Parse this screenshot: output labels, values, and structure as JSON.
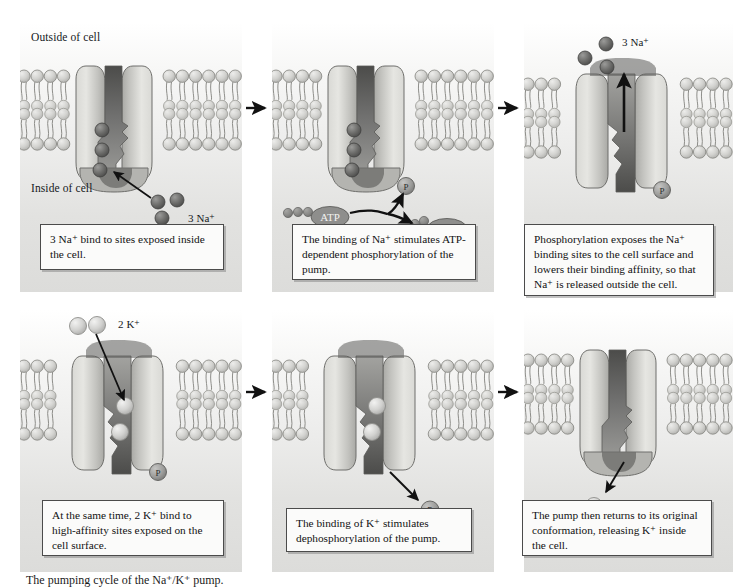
{
  "figure": {
    "caption": "The pumping cycle of the Na⁺/K⁺ pump."
  },
  "colors": {
    "panel_bg_top": "#ffffff",
    "panel_bg_bottom": "#dcdcda",
    "membrane_head": "#c9c9c7",
    "membrane_head_light": "#e3e3e1",
    "membrane_tail": "#a9a9a6",
    "protein_light": "#dcdcd8",
    "protein_mid": "#b6b6b2",
    "channel_dark": "#6d6d6a",
    "channel_darkest": "#4f4f4d",
    "sodium_ion": "#6a6a68",
    "potassium_ion": "#cccccb",
    "phosphate": "#9a9a98",
    "nucleotide": "#8c8c8a",
    "arrow": "#111111",
    "textbox_border": "#4b4b4b",
    "textbox_fill": "#fbfbfa"
  },
  "flow_arrows": [
    {
      "name": "arrow-panel1-to-panel2",
      "direction": "right"
    },
    {
      "name": "arrow-panel2-to-panel3",
      "direction": "right"
    },
    {
      "name": "arrow-panel4-to-panel5",
      "direction": "right"
    },
    {
      "name": "arrow-panel5-to-panel6",
      "direction": "right"
    }
  ],
  "panels": [
    {
      "id": "panel-1",
      "step": 1,
      "conformation": "inward-open",
      "membrane_labels": {
        "outside": "Outside of cell",
        "inside": "Inside of cell"
      },
      "ion_label": "3 Na⁺",
      "ion_label_plain": "3 Na+",
      "ions": {
        "type": "sodium",
        "bound_count": 3,
        "free_count": 3
      },
      "phosphate_present": false,
      "arrow_note": "binding arrow from cytosolic Na+ to bound sites",
      "text": "3 Na⁺ bind to sites exposed inside the cell.",
      "text_plain": "3 Na+ bind to sites exposed inside the cell."
    },
    {
      "id": "panel-2",
      "step": 2,
      "conformation": "inward-open",
      "ion_label": "",
      "ions": {
        "type": "sodium",
        "bound_count": 3,
        "free_count": 0
      },
      "phosphate_present": true,
      "phosphate_label": "P",
      "atp_label": "ATP",
      "adp_label": "ADP",
      "atp_phosphate_dots": 3,
      "adp_phosphate_dots": 2,
      "text": "The binding of Na⁺ stimulates ATP-dependent phosphorylation of the pump.",
      "text_plain": "The binding of Na+ stimulates ATP-dependent phosphorylation of the pump."
    },
    {
      "id": "panel-3",
      "step": 3,
      "conformation": "outward-open",
      "ion_label": "3 Na⁺",
      "ion_label_plain": "3 Na+",
      "ions": {
        "type": "sodium",
        "bound_count": 0,
        "free_count": 3
      },
      "phosphate_present": true,
      "phosphate_label": "P",
      "arrow_note": "upward arrow showing Na+ release outside",
      "text": "Phosphorylation exposes the Na⁺ binding sites to the cell surface and lowers their binding affinity, so that Na⁺ is released outside the cell.",
      "text_plain": "Phosphorylation exposes the Na+ binding sites to the cell surface and lowers their binding affinity, so that Na+ is released outside the cell."
    },
    {
      "id": "panel-4",
      "step": 4,
      "conformation": "outward-open",
      "ion_label": "2 K⁺",
      "ion_label_plain": "2 K+",
      "ions": {
        "type": "potassium",
        "bound_count": 2,
        "free_count": 2
      },
      "phosphate_present": true,
      "phosphate_label": "P",
      "arrow_note": "binding arrow from extracellular K+ into pump sites",
      "text": "At the same time, 2 K⁺ bind to high-affinity sites exposed on the cell surface.",
      "text_plain": "At the same time, 2 K+ bind to high-affinity sites exposed on the cell surface."
    },
    {
      "id": "panel-5",
      "step": 5,
      "conformation": "outward-open",
      "ion_label": "",
      "ions": {
        "type": "potassium",
        "bound_count": 2,
        "free_count": 0
      },
      "phosphate_present": true,
      "phosphate_label": "P",
      "arrow_note": "arrow showing phosphate leaving the pump",
      "text": "The binding of K⁺ stimulates dephosphorylation of the pump.",
      "text_plain": "The binding of K+ stimulates dephosphorylation of the pump."
    },
    {
      "id": "panel-6",
      "step": 6,
      "conformation": "inward-open",
      "ion_label": "2 K⁺",
      "ion_label_plain": "2 K+",
      "ions": {
        "type": "potassium",
        "bound_count": 0,
        "free_count": 2
      },
      "phosphate_present": false,
      "arrow_note": "arrow showing K+ release inside the cell",
      "text": "The pump then returns to its original conformation, releasing K⁺ inside the cell.",
      "text_plain": "The pump then returns to its original conformation, releasing K+ inside the cell."
    }
  ]
}
